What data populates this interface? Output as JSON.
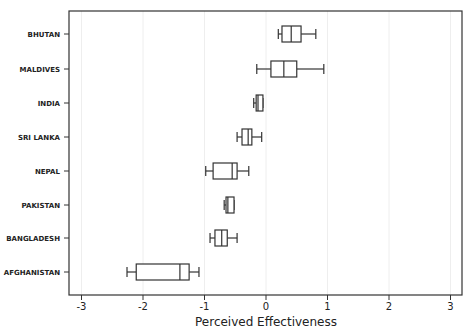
{
  "chart_data": {
    "type": "boxplot",
    "orientation": "horizontal",
    "title": "",
    "xlabel": "Perceived Effectiveness",
    "ylabel": "",
    "xlim": [
      -3.2,
      3.2
    ],
    "xticks": [
      -3,
      -2,
      -1,
      0,
      1,
      2,
      3
    ],
    "xtick_labels": [
      "-3",
      "-2",
      "-1",
      "0",
      "1",
      "2",
      "3"
    ],
    "grid": "vertical, faint, at integer ticks",
    "legend": "none",
    "categories": [
      "BHUTAN",
      "MALDIVES",
      "INDIA",
      "SRI LANKA",
      "NEPAL",
      "PAKISTAN",
      "BANGLADESH",
      "AFGHANISTAN"
    ],
    "boxes": [
      {
        "label": "BHUTAN",
        "whisker_low": 0.2,
        "q1": 0.26,
        "median": 0.41,
        "q3": 0.57,
        "whisker_high": 0.81
      },
      {
        "label": "MALDIVES",
        "whisker_low": -0.15,
        "q1": 0.08,
        "median": 0.29,
        "q3": 0.5,
        "whisker_high": 0.94
      },
      {
        "label": "INDIA",
        "whisker_low": -0.2,
        "q1": -0.16,
        "median": -0.13,
        "q3": -0.05,
        "whisker_high": -0.05
      },
      {
        "label": "SRI LANKA",
        "whisker_low": -0.47,
        "q1": -0.39,
        "median": -0.29,
        "q3": -0.23,
        "whisker_high": -0.07
      },
      {
        "label": "NEPAL",
        "whisker_low": -0.98,
        "q1": -0.86,
        "median": -0.55,
        "q3": -0.47,
        "whisker_high": -0.28
      },
      {
        "label": "PAKISTAN",
        "whisker_low": -0.68,
        "q1": -0.65,
        "median": -0.62,
        "q3": -0.52,
        "whisker_high": -0.52
      },
      {
        "label": "BANGLADESH",
        "whisker_low": -0.91,
        "q1": -0.83,
        "median": -0.72,
        "q3": -0.63,
        "whisker_high": -0.47
      },
      {
        "label": "AFGHANISTAN",
        "whisker_low": -2.26,
        "q1": -2.11,
        "median": -1.4,
        "q3": -1.25,
        "whisker_high": -1.09
      }
    ],
    "colors": {
      "box_stroke": "#333333",
      "axis": "#333333",
      "grid": "#eeeeee",
      "background": "#ffffff"
    }
  }
}
